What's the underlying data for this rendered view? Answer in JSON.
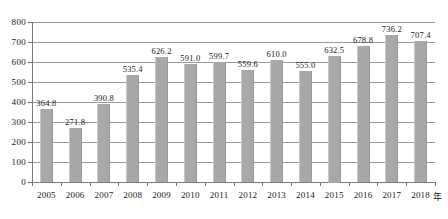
{
  "chart_data": {
    "type": "bar",
    "title": "",
    "subtitle": "",
    "xlabel": "年",
    "ylabel": "",
    "categories": [
      "2005",
      "2006",
      "2007",
      "2008",
      "2009",
      "2010",
      "2011",
      "2012",
      "2013",
      "2014",
      "2015",
      "2016",
      "2017",
      "2018"
    ],
    "values": [
      364.8,
      271.8,
      390.8,
      535.4,
      626.2,
      591.0,
      599.7,
      559.6,
      610.0,
      555.0,
      632.5,
      678.8,
      736.2,
      707.4
    ],
    "value_labels": [
      "364.8",
      "271.8",
      "390.8",
      "535.4",
      "626.2",
      "591.0",
      "599.7",
      "559.6",
      "610.0",
      "555.0",
      "632.5",
      "678.8",
      "736.2",
      "707.4"
    ],
    "ylim": [
      0,
      800
    ],
    "ytick_values": [
      0,
      100,
      200,
      300,
      400,
      500,
      600,
      700,
      800
    ],
    "ytick_labels": [
      "0",
      "100",
      "200",
      "300",
      "400",
      "500",
      "600",
      "700",
      "800"
    ],
    "grid": true,
    "legend": null,
    "legend_position": "none",
    "bar_color": "#a8a8a8",
    "gridline_color": "#9a9a9a",
    "axis_color": "#7a7a7a",
    "text_color": "#1a1a1a"
  }
}
